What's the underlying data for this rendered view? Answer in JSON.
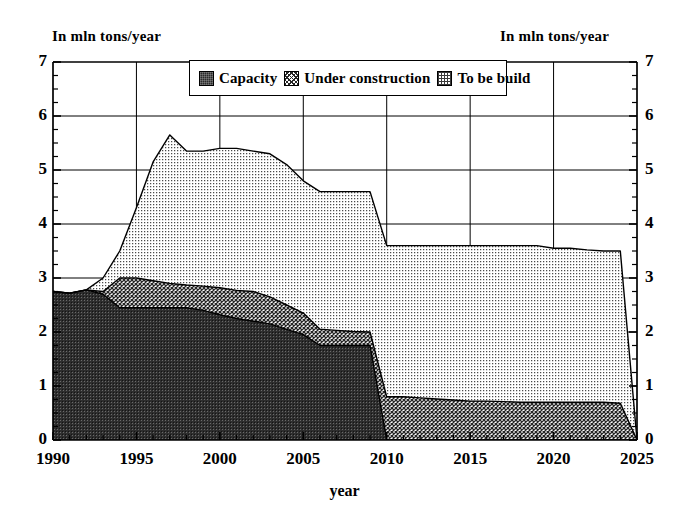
{
  "chart_data": {
    "type": "area",
    "stacked": true,
    "title": "",
    "xlabel": "year",
    "ylabel": "In mln tons/year",
    "ylabel_right": "In mln tons/year",
    "xlim": [
      1990,
      2025
    ],
    "ylim": [
      0,
      7
    ],
    "ytick_values": [
      0,
      1,
      2,
      3,
      4,
      5,
      6,
      7
    ],
    "ytick_labels": [
      "0",
      "1",
      "2",
      "3",
      "4",
      "5",
      "6",
      "7"
    ],
    "xtick_values": [
      1990,
      1995,
      2000,
      2005,
      2010,
      2015,
      2020,
      2025
    ],
    "xtick_labels": [
      "1990",
      "1995",
      "2000",
      "2005",
      "2010",
      "2015",
      "2020",
      "2025"
    ],
    "minor_ticks_y": 0.25,
    "minor_ticks_x": 1,
    "grid": "major-y-and-x",
    "legend_position": "top-center",
    "x": [
      1990,
      1991,
      1992,
      1993,
      1994,
      1995,
      1996,
      1997,
      1998,
      1999,
      2000,
      2001,
      2002,
      2003,
      2004,
      2005,
      2006,
      2007,
      2008,
      2009,
      2010,
      2011,
      2012,
      2013,
      2014,
      2015,
      2016,
      2017,
      2018,
      2019,
      2020,
      2021,
      2022,
      2023,
      2024,
      2025
    ],
    "series": [
      {
        "name": "Capacity",
        "color": "#2a2a2a",
        "pattern": "dense-dark",
        "values": [
          2.75,
          2.72,
          2.78,
          2.7,
          2.45,
          2.45,
          2.45,
          2.45,
          2.45,
          2.4,
          2.32,
          2.25,
          2.2,
          2.15,
          2.05,
          1.95,
          1.75,
          1.75,
          1.75,
          1.75,
          0.0,
          0.0,
          0.0,
          0.0,
          0.0,
          0.0,
          0.0,
          0.0,
          0.0,
          0.0,
          0.0,
          0.0,
          0.0,
          0.0,
          0.0,
          0.0
        ]
      },
      {
        "name": "Under construction",
        "color": "#555555",
        "pattern": "cross-hatch",
        "values": [
          0.0,
          0.0,
          0.0,
          0.05,
          0.55,
          0.55,
          0.5,
          0.45,
          0.42,
          0.45,
          0.5,
          0.52,
          0.55,
          0.5,
          0.45,
          0.4,
          0.3,
          0.28,
          0.26,
          0.25,
          0.8,
          0.8,
          0.78,
          0.76,
          0.74,
          0.72,
          0.72,
          0.71,
          0.7,
          0.7,
          0.7,
          0.7,
          0.7,
          0.7,
          0.68,
          0.0
        ]
      },
      {
        "name": "To be build",
        "color": "#d0d0d0",
        "pattern": "light-dot",
        "values": [
          0.0,
          0.0,
          0.0,
          0.25,
          0.5,
          1.3,
          2.2,
          2.75,
          2.48,
          2.5,
          2.58,
          2.63,
          2.6,
          2.65,
          2.6,
          2.45,
          2.55,
          2.57,
          2.59,
          2.6,
          2.8,
          2.8,
          2.82,
          2.84,
          2.86,
          2.88,
          2.88,
          2.89,
          2.9,
          2.9,
          2.85,
          2.85,
          2.82,
          2.8,
          2.82,
          0.0
        ]
      }
    ],
    "totals": [
      2.75,
      2.72,
      2.78,
      3.0,
      3.5,
      4.3,
      5.15,
      5.35,
      5.35,
      5.35,
      5.4,
      5.4,
      5.35,
      5.3,
      5.1,
      4.8,
      4.6,
      4.6,
      4.6,
      4.6,
      3.6,
      3.6,
      3.6,
      3.6,
      3.6,
      3.6,
      3.6,
      3.6,
      3.6,
      3.6,
      3.55,
      3.55,
      3.52,
      3.5,
      3.5,
      0.0
    ],
    "annotations": []
  },
  "legend": {
    "items": [
      {
        "label": "Capacity",
        "swatch": "capacity-swatch"
      },
      {
        "label": "Under construction",
        "swatch": "under-construction-swatch"
      },
      {
        "label": "To be build",
        "swatch": "to-be-build-swatch"
      }
    ]
  },
  "colors": {
    "capacity": "#2a2a2a",
    "under_construction": "#555555",
    "to_be_build": "#d0d0d0",
    "axis": "#000000",
    "background": "#ffffff"
  }
}
